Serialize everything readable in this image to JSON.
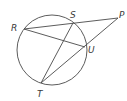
{
  "diagram": {
    "type": "circle-secants",
    "circle": {
      "cx": 52,
      "cy": 50,
      "r": 35
    },
    "points": {
      "R": {
        "x": 24,
        "y": 29,
        "label": "R",
        "lx": 11,
        "ly": 31
      },
      "S": {
        "x": 73,
        "y": 23,
        "label": "S",
        "lx": 70,
        "ly": 18
      },
      "P": {
        "x": 118,
        "y": 18,
        "label": "P",
        "lx": 119,
        "ly": 18
      },
      "U": {
        "x": 85,
        "y": 47,
        "label": "U",
        "lx": 88,
        "ly": 53
      },
      "T": {
        "x": 41,
        "y": 83,
        "label": "T",
        "lx": 37,
        "ly": 97
      }
    },
    "segments": [
      {
        "from": "R",
        "to": "P",
        "name": "secant-RP"
      },
      {
        "from": "T",
        "to": "P",
        "name": "secant-TP"
      },
      {
        "from": "R",
        "to": "U",
        "name": "chord-RU"
      },
      {
        "from": "S",
        "to": "T",
        "name": "chord-ST"
      }
    ],
    "colors": {
      "line": "#4a4a4a",
      "label": "#3a3a3a",
      "background": "#ffffff"
    }
  }
}
